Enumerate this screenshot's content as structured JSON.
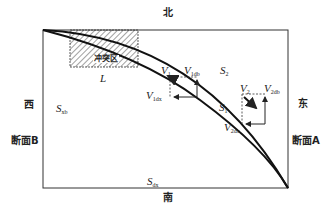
{
  "directions": {
    "north": "北",
    "south": "南",
    "west": "西",
    "east": "东"
  },
  "sections": {
    "a": "断面A",
    "b": "断面B"
  },
  "conflict_zone": {
    "label": "冲突区",
    "length_label": "L"
  },
  "surfaces": {
    "s1": {
      "main": "S",
      "sub": "1"
    },
    "s2": {
      "main": "S",
      "sub": "2"
    },
    "sxb": {
      "main": "S",
      "sub": "xb"
    },
    "sdx": {
      "main": "S",
      "sub": "dx"
    }
  },
  "vectors": {
    "v1": {
      "main": "V",
      "sub": "1"
    },
    "v2": {
      "main": "V",
      "sub": "2"
    },
    "v1db": {
      "main": "V",
      "sub": "1db"
    },
    "v1dx": {
      "main": "V",
      "sub": "1dx"
    },
    "v2db": {
      "main": "V",
      "sub": "2db"
    },
    "v2dx": {
      "main": "V",
      "sub": "2dx"
    }
  },
  "colors": {
    "line": "#222222",
    "background": "#ffffff"
  }
}
